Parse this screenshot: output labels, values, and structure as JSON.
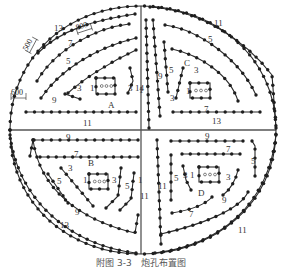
{
  "caption": "附图 3-3　炮孔布置图",
  "colors": {
    "line": "#2a2a2a",
    "hole": "#1e1e1e",
    "axis": "#555555",
    "text": "#333333"
  },
  "dimensions": [
    {
      "label": "500",
      "x": 32,
      "y": 46,
      "rotate": -62
    },
    {
      "label": "800",
      "x": 84,
      "y": 30,
      "rotate": -18
    },
    {
      "label": "600",
      "x": 18,
      "y": 97,
      "rotate": 0
    }
  ],
  "quadrant_labels": [
    {
      "label": "A",
      "x": 108,
      "y": 108
    },
    {
      "label": "C",
      "x": 184,
      "y": 66
    },
    {
      "label": "B",
      "x": 88,
      "y": 166
    },
    {
      "label": "D",
      "x": 198,
      "y": 196
    }
  ],
  "ring_labels": [
    {
      "label": "13",
      "x": 54,
      "y": 31
    },
    {
      "label": "7",
      "x": 68,
      "y": 46
    },
    {
      "label": "5",
      "x": 66,
      "y": 64
    },
    {
      "label": "3",
      "x": 77,
      "y": 91
    },
    {
      "label": "1",
      "x": 90,
      "y": 91
    },
    {
      "label": "3",
      "x": 128,
      "y": 91
    },
    {
      "label": "1",
      "x": 139,
      "y": 93
    },
    {
      "label": "9",
      "x": 52,
      "y": 103
    },
    {
      "label": "11",
      "x": 83,
      "y": 126
    },
    {
      "label": "14",
      "x": 135,
      "y": 91
    },
    {
      "label": "11",
      "x": 214,
      "y": 26
    },
    {
      "label": "5",
      "x": 208,
      "y": 42
    },
    {
      "label": "9",
      "x": 158,
      "y": 79
    },
    {
      "label": "5",
      "x": 169,
      "y": 73
    },
    {
      "label": "3",
      "x": 194,
      "y": 73
    },
    {
      "label": "3",
      "x": 170,
      "y": 101
    },
    {
      "label": "1",
      "x": 186,
      "y": 94
    },
    {
      "label": "7",
      "x": 204,
      "y": 112
    },
    {
      "label": "13",
      "x": 212,
      "y": 124
    },
    {
      "label": "9",
      "x": 66,
      "y": 140
    },
    {
      "label": "9",
      "x": 205,
      "y": 139
    },
    {
      "label": "7",
      "x": 74,
      "y": 157
    },
    {
      "label": "7",
      "x": 226,
      "y": 152
    },
    {
      "label": "3",
      "x": 68,
      "y": 171
    },
    {
      "label": "5",
      "x": 57,
      "y": 184
    },
    {
      "label": "1",
      "x": 83,
      "y": 183
    },
    {
      "label": "3",
      "x": 112,
      "y": 183
    },
    {
      "label": "5",
      "x": 125,
      "y": 189
    },
    {
      "label": "1",
      "x": 138,
      "y": 183
    },
    {
      "label": "11",
      "x": 140,
      "y": 199
    },
    {
      "label": "9",
      "x": 75,
      "y": 215
    },
    {
      "label": "13",
      "x": 60,
      "y": 228
    },
    {
      "label": "5",
      "x": 174,
      "y": 181
    },
    {
      "label": "11",
      "x": 158,
      "y": 189
    },
    {
      "label": "3",
      "x": 183,
      "y": 178
    },
    {
      "label": "1",
      "x": 190,
      "y": 178
    },
    {
      "label": "5",
      "x": 251,
      "y": 164
    },
    {
      "label": "3",
      "x": 226,
      "y": 180
    },
    {
      "label": "9",
      "x": 222,
      "y": 203
    },
    {
      "label": "7",
      "x": 189,
      "y": 217
    },
    {
      "label": "11",
      "x": 238,
      "y": 233
    }
  ],
  "cut_boxes": [
    {
      "id": "A",
      "x": 96,
      "y": 78,
      "w": 19,
      "h": 16
    },
    {
      "id": "C",
      "x": 190,
      "y": 83,
      "w": 20,
      "h": 15
    },
    {
      "id": "B",
      "x": 89,
      "y": 174,
      "w": 19,
      "h": 15
    },
    {
      "id": "D",
      "x": 199,
      "y": 167,
      "w": 20,
      "h": 15
    }
  ]
}
